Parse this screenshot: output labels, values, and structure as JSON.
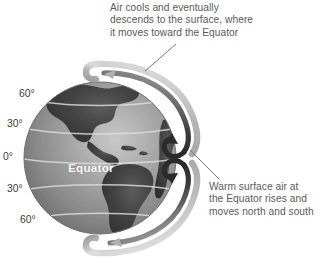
{
  "figure": {
    "title_text": "Atmospheric circulation cell diagram",
    "background_color": "#ffffff"
  },
  "callouts": {
    "top": {
      "name": "upper-air-callout",
      "lines": [
        "Air cools and eventually",
        "descends to the surface, where",
        "it moves toward the Equator"
      ],
      "line1": "Air cools and eventually",
      "line2": "descends to the surface, where",
      "line3": "it moves toward the Equator",
      "color": "#5a5a5a"
    },
    "right": {
      "name": "surface-air-callout",
      "lines": [
        "Warm surface air at",
        "the Equator rises and",
        "moves north and south"
      ],
      "line1": "Warm surface air at",
      "line2": "the Equator rises and",
      "line3": "moves north and south",
      "color": "#5a5a5a"
    }
  },
  "globe": {
    "name": "earth-globe",
    "equator_label": "Equator",
    "ocean_color": "#8c8c8c",
    "land_color": "#3f3f3f",
    "graticule_color": "#d8d8d8",
    "latitude_labels": [
      {
        "id": "n60",
        "text": "60°"
      },
      {
        "id": "n30",
        "text": "30°"
      },
      {
        "id": "eq0",
        "text": "0°"
      },
      {
        "id": "s30",
        "text": "30°"
      },
      {
        "id": "s60",
        "text": "60°"
      }
    ]
  },
  "circulation": {
    "name": "hadley-cell-arrows",
    "dark_arrow_color": "#2b2b2b",
    "light_arrow_color": "#b9b9b9",
    "mid_arrow_color": "#8f8f8f",
    "arrows": [
      {
        "id": "north-cell-rise",
        "direction": "up",
        "label": "rising air north of Equator"
      },
      {
        "id": "south-cell-rise",
        "direction": "down",
        "label": "rising air south of Equator"
      },
      {
        "id": "north-cell-descend",
        "direction": "descending",
        "label": "poleward descending branch north"
      },
      {
        "id": "south-cell-descend",
        "direction": "descending",
        "label": "poleward descending branch south"
      }
    ]
  },
  "leader_lines": {
    "top": {
      "name": "leader-line-top",
      "from_x": 145,
      "from_y": 71,
      "to_x": 176,
      "to_y": 44
    },
    "right": {
      "name": "leader-line-right",
      "from_x": 190,
      "from_y": 150,
      "to_x": 219,
      "to_y": 179
    }
  }
}
